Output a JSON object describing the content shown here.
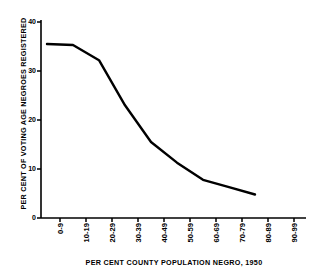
{
  "chart_data": {
    "type": "line",
    "title": "",
    "xlabel": "PER CENT COUNTY POPULATION NEGRO, 1950",
    "ylabel": "PER CENT OF VOTING AGE NEGROES REGISTERED",
    "categories": [
      "0-9",
      "10-19",
      "20-29",
      "30-39",
      "40-49",
      "50-59",
      "60-69",
      "70-79",
      "80-89",
      "90-99"
    ],
    "values": [
      35.5,
      35.3,
      32.2,
      23.0,
      15.5,
      11.3,
      7.8,
      6.3,
      4.8,
      null
    ],
    "series": [
      {
        "name": "Per cent of voting age Negroes registered",
        "values": [
          35.5,
          35.3,
          32.2,
          23.0,
          15.5,
          11.3,
          7.8,
          6.3,
          4.8,
          null
        ]
      }
    ],
    "ylim": [
      0,
      40
    ],
    "yticks": [
      0,
      10,
      20,
      30,
      40
    ],
    "ytick_labels": [
      "0",
      "10",
      "20",
      "30",
      "40"
    ],
    "grid": false,
    "legend": false,
    "legend_position": "none",
    "line_color": "#000000",
    "line_width": 2.4,
    "background_color": "#ffffff",
    "axis_color": "#000000"
  }
}
